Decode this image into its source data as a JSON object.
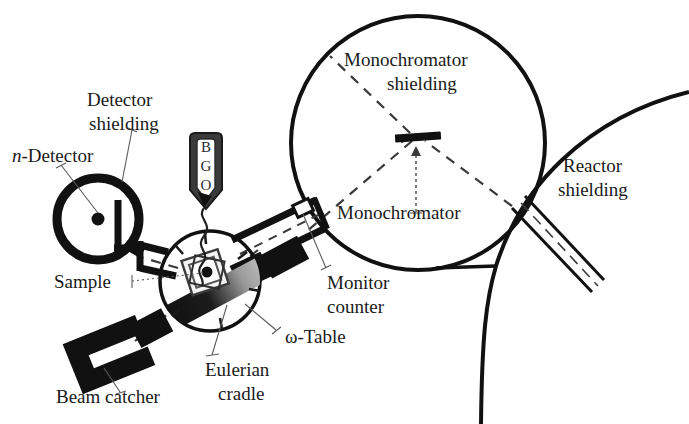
{
  "figure": {
    "background_color": "#ffffff",
    "ink_color": "#111111",
    "leader_color": "#5a5a5a",
    "width": 689,
    "height": 424
  },
  "labels": {
    "detector_shielding": "Detector\nshielding",
    "detector_shielding_line1": "Detector",
    "detector_shielding_line2": "shielding",
    "n_detector_italic": "n",
    "n_detector_rest": "-Detector",
    "sample": "Sample",
    "beam_catcher": "Beam catcher",
    "eulerian_cradle_line1": "Eulerian",
    "eulerian_cradle_line2": "cradle",
    "omega_table": "ω-Table",
    "monitor_counter_line1": "Monitor",
    "monitor_counter_line2": "counter",
    "monochromator": "Monochromator",
    "monochromator_shielding_line1": "Monochromator",
    "monochromator_shielding_line2": "shielding",
    "reactor_shielding_line1": "Reactor",
    "reactor_shielding_line2": "shielding"
  },
  "bgo_detector": {
    "letters": [
      "B",
      "G",
      "O"
    ],
    "name": "BGO scintillation detector"
  },
  "components": {
    "monochromator_shielding_circle": {
      "cx": 418,
      "cy": 143,
      "r": 127,
      "stroke_width": 4
    },
    "sample_stage_circle": {
      "cx": 210,
      "cy": 281,
      "r": 52,
      "stroke_width": 3.5
    },
    "n_detector_circle": {
      "cx": 98,
      "cy": 219,
      "r": 41,
      "stroke_width": 8
    },
    "n_detector_dot": {
      "cx": 98,
      "cy": 219,
      "r": 6
    },
    "monochromator_crystal": {
      "cx": 418,
      "cy": 137,
      "width": 46,
      "height": 7,
      "angle": -4
    },
    "omega_table_gradient": {
      "from": "#0d0d0d",
      "to": "#e8e8e8"
    }
  },
  "beam_paths": {
    "incident_dashed": "reactor-to-monochromator",
    "diffracted_dashed": "monochromator-to-sample",
    "shield_dashed": "monochromator-to-upper-left"
  }
}
